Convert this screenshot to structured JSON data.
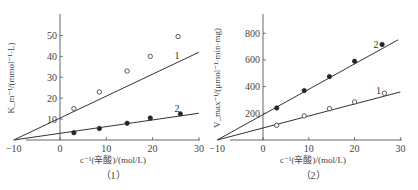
{
  "chart_data": [
    {
      "type": "line",
      "panel_label": "（1）",
      "title": "",
      "xlabel": "c⁻¹(辛酸)/(mol/L)",
      "ylabel": "K_m⁻¹/(mmol⁻¹·L)",
      "xlim": [
        -10,
        30
      ],
      "ylim": [
        0,
        57
      ],
      "x_ticks": [
        "-10",
        "0",
        "10",
        "20",
        "30"
      ],
      "y_ticks": [
        "10",
        "20",
        "30",
        "40",
        "50"
      ],
      "grid": false,
      "series": [
        {
          "name": "1",
          "marker": "open-circle",
          "x": [
            3,
            8.5,
            14.5,
            19.5,
            25.5
          ],
          "values": [
            15,
            23,
            33,
            40,
            49.5
          ],
          "fit_line": {
            "x_intercept": -10,
            "y_intercept": 10.5,
            "x_end": 30
          }
        },
        {
          "name": "2",
          "marker": "filled-circle",
          "x": [
            3,
            8.5,
            14.5,
            19.5,
            26
          ],
          "values": [
            3.5,
            5.5,
            8,
            10.5,
            12.5
          ],
          "fit_line": {
            "x_intercept": -10,
            "y_intercept": 3.2,
            "x_end": 30
          }
        }
      ]
    },
    {
      "type": "line",
      "panel_label": "（2）",
      "title": "",
      "xlabel": "c⁻¹(辛酸)/(mol/L)",
      "ylabel": "V_max⁻¹/(μmol⁻¹·min·mg)",
      "xlim": [
        -10,
        30
      ],
      "ylim": [
        0,
        930
      ],
      "x_ticks": [
        "-10",
        "0",
        "10",
        "20",
        "30"
      ],
      "y_ticks": [
        "200",
        "400",
        "600",
        "800"
      ],
      "grid": false,
      "series": [
        {
          "name": "1",
          "marker": "open-circle",
          "x": [
            3,
            9,
            14.5,
            20,
            26.5
          ],
          "values": [
            110,
            180,
            235,
            285,
            350
          ],
          "fit_line": {
            "x_intercept": -10,
            "y_intercept": 90,
            "x_end": 30
          }
        },
        {
          "name": "2",
          "marker": "filled-circle",
          "x": [
            3,
            9,
            14.5,
            20,
            26
          ],
          "values": [
            240,
            370,
            475,
            590,
            715
          ],
          "fit_line": {
            "x_intercept": -10,
            "y_intercept": 190,
            "x_end": 29.5
          }
        }
      ]
    }
  ]
}
